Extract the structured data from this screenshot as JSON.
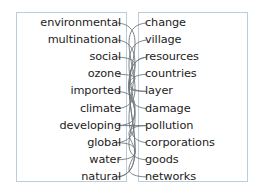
{
  "figure": {
    "type": "two-column word association diagram",
    "background_color": "#ffffff",
    "panel_border_color": "#b9cddd",
    "link_color": "#6f7679",
    "text_color": "#1c1c1c"
  },
  "left_panel": {
    "words": [
      "environmental",
      "multinational",
      "social",
      "ozone",
      "imported",
      "climate",
      "developing",
      "global",
      "water",
      "natural"
    ]
  },
  "right_panel": {
    "words": [
      "change",
      "village",
      "resources",
      "countries",
      "layer",
      "damage",
      "pollution",
      "corporations",
      "goods",
      "networks"
    ]
  },
  "links": [
    {
      "from": "environmental",
      "to": "damage",
      "left_index": 0,
      "right_index": 5
    },
    {
      "from": "multinational",
      "to": "corporations",
      "left_index": 1,
      "right_index": 7
    },
    {
      "from": "social",
      "to": "layer",
      "left_index": 2,
      "right_index": 4
    },
    {
      "from": "ozone",
      "to": "layer",
      "left_index": 3,
      "right_index": 4
    },
    {
      "from": "imported",
      "to": "goods",
      "left_index": 4,
      "right_index": 8
    },
    {
      "from": "climate",
      "to": "change",
      "left_index": 5,
      "right_index": 0
    },
    {
      "from": "developing",
      "to": "countries",
      "left_index": 6,
      "right_index": 3
    },
    {
      "from": "developing",
      "to": "pollution",
      "left_index": 6,
      "right_index": 6
    },
    {
      "from": "global",
      "to": "village",
      "left_index": 7,
      "right_index": 1
    },
    {
      "from": "global",
      "to": "networks",
      "left_index": 7,
      "right_index": 9
    },
    {
      "from": "water",
      "to": "pollution",
      "left_index": 8,
      "right_index": 6
    },
    {
      "from": "water",
      "to": "resources",
      "left_index": 9,
      "right_index": 2
    },
    {
      "from": "natural",
      "to": "resources",
      "left_index": 9,
      "right_index": 2
    }
  ]
}
